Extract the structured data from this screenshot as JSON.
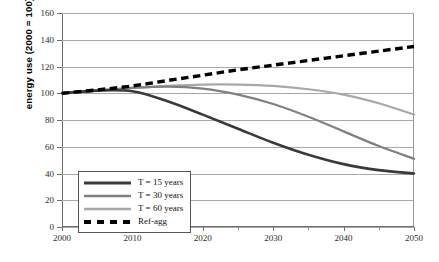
{
  "chart_data": {
    "type": "line",
    "title": "",
    "xlabel": "",
    "ylabel": "energy use (2000 = 100)",
    "xlim": [
      2000,
      2050
    ],
    "ylim": [
      0,
      160
    ],
    "ytick_step": 20,
    "xtick_step": 10,
    "x_minor_step": 5,
    "grid": "horizontal",
    "legend_position": "inside lower-left",
    "yticks": [
      "0",
      "20",
      "40",
      "60",
      "80",
      "100",
      "120",
      "140",
      "160"
    ],
    "xticks": [
      "2000",
      "2010",
      "2020",
      "2030",
      "2040",
      "2050"
    ],
    "x_minor_ticks": [
      2005,
      2015,
      2025,
      2035,
      2045
    ],
    "x": [
      2000,
      2005,
      2010,
      2015,
      2020,
      2025,
      2030,
      2035,
      2040,
      2045,
      2050
    ],
    "series": [
      {
        "name": "T = 15 years",
        "color": "#3a3a3a",
        "width": 2.6,
        "dash": "solid",
        "values": [
          100,
          102,
          101.5,
          94,
          84,
          73.5,
          63,
          54,
          47,
          42.5,
          40
        ]
      },
      {
        "name": "T = 30 years",
        "color": "#808080",
        "width": 2.2,
        "dash": "solid",
        "values": [
          100,
          102,
          104,
          105,
          103.5,
          99,
          92,
          82.5,
          71.5,
          60.5,
          51
        ]
      },
      {
        "name": "T = 60 years",
        "color": "#a8a8a8",
        "width": 2.2,
        "dash": "solid",
        "values": [
          100,
          102,
          104,
          105.5,
          106.5,
          106.5,
          105.5,
          103,
          99,
          92.5,
          84
        ]
      },
      {
        "name": "Ref-agg",
        "color": "#000000",
        "width": 3.4,
        "dash": "dashed",
        "values": [
          100,
          102.5,
          105.5,
          109.5,
          113.5,
          117.5,
          121,
          124.5,
          128,
          131.5,
          135
        ]
      }
    ]
  },
  "legend": {
    "entries": [
      {
        "label": "T = 15 years"
      },
      {
        "label": "T = 30 years"
      },
      {
        "label": "T = 60 years"
      },
      {
        "label": "Ref-agg"
      }
    ]
  }
}
